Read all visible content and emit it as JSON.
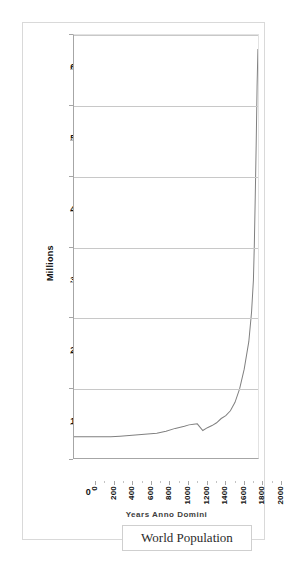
{
  "chart_data": {
    "type": "line",
    "title": "",
    "xlabel": "Years Anno Domini",
    "ylabel": "Millions",
    "xlim": [
      0,
      2000
    ],
    "ylim": [
      0,
      6000
    ],
    "grid": true,
    "legend_position": "bottom",
    "series_name": "World Population",
    "x_ticks": [
      "0",
      "200",
      "400",
      "600",
      "800",
      "1000",
      "1200",
      "1400",
      "1600",
      "1800",
      "2000"
    ],
    "y_ticks": [
      "0",
      "1000",
      "2000",
      "3000",
      "4000",
      "5000",
      "6000"
    ],
    "line_color": "#808080",
    "gridline_color": "#c8c8c8",
    "axis_color": "#a6a6a6",
    "x": [
      0,
      100,
      200,
      300,
      400,
      500,
      600,
      700,
      800,
      900,
      1000,
      1100,
      1200,
      1250,
      1300,
      1340,
      1400,
      1450,
      1500,
      1550,
      1600,
      1650,
      1700,
      1750,
      1800,
      1850,
      1900,
      1930,
      1950,
      1960,
      1970,
      1980,
      1990,
      1999
    ],
    "values": [
      300,
      300,
      300,
      300,
      300,
      310,
      320,
      330,
      340,
      350,
      380,
      420,
      450,
      470,
      480,
      485,
      390,
      430,
      460,
      500,
      560,
      600,
      670,
      790,
      980,
      1260,
      1650,
      2070,
      2520,
      3020,
      3700,
      4430,
      5270,
      5800
    ],
    "annotations": [
      {
        "label": "Black Death decline",
        "x": 1400,
        "y": 390
      },
      {
        "label": "Peak value",
        "x": 1999,
        "y": 5800
      }
    ]
  },
  "legend": {
    "label": "World Population"
  },
  "axes": {
    "y_title": "Millions",
    "x_title": "Years Anno Domini"
  }
}
